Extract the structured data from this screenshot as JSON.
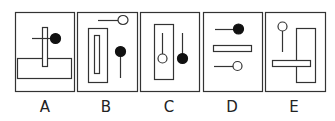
{
  "figure": {
    "type": "answer-options",
    "stroke_color": "#333333",
    "fill_color": "#111111",
    "options": [
      {
        "label": "A",
        "description": "Wide horizontal rectangle with a thin vertical rectangle crossing it; short line ending in a filled circle to the right of the vertical bar"
      },
      {
        "label": "B",
        "description": "Tall rectangle with inner slot; line ending in hollow circle at top right; filled circle on vertical stem to the right"
      },
      {
        "label": "C",
        "description": "Tall rectangle containing a stem with hollow circle; outside it a stem with filled circle"
      },
      {
        "label": "D",
        "description": "Line with filled circle on top; horizontal bar in middle; line with hollow circle at bottom"
      },
      {
        "label": "E",
        "description": "Hollow circle on vertical stem at top left; tall rectangle at right; horizontal bar crossing the tall rectangle"
      }
    ]
  }
}
